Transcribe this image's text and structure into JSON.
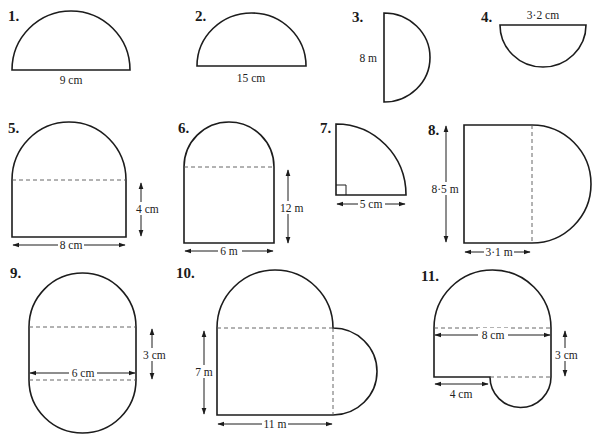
{
  "figures": [
    {
      "number": "1.",
      "shape": "semicircle",
      "dimension": "9 cm",
      "dimension_type": "diameter"
    },
    {
      "number": "2.",
      "shape": "semicircle",
      "dimension": "15 cm",
      "dimension_type": "diameter"
    },
    {
      "number": "3.",
      "shape": "semicircle",
      "dimension": "8 m",
      "dimension_type": "diameter"
    },
    {
      "number": "4.",
      "shape": "semicircle",
      "dimension": "3·2 cm",
      "dimension_type": "diameter"
    },
    {
      "number": "5.",
      "shape": "rectangle with semicircle",
      "dimensions": [
        "8 cm",
        "4 cm"
      ]
    },
    {
      "number": "6.",
      "shape": "rectangle with semicircle",
      "dimensions": [
        "6 m",
        "12 m"
      ]
    },
    {
      "number": "7.",
      "shape": "quarter circle",
      "dimension": "5 cm",
      "dimension_type": "radius"
    },
    {
      "number": "8.",
      "shape": "rectangle with semicircle",
      "dimensions": [
        "8·5 m",
        "3·1 m"
      ]
    },
    {
      "number": "9.",
      "shape": "rectangle with two semicircles",
      "dimensions": [
        "6 cm",
        "3 cm"
      ]
    },
    {
      "number": "10.",
      "shape": "rectangle with two semicircles",
      "dimensions": [
        "7 m",
        "11 m"
      ]
    },
    {
      "number": "11.",
      "shape": "composite rectangle with semicircles",
      "dimensions": [
        "8 cm",
        "3 cm",
        "4 cm"
      ]
    }
  ]
}
